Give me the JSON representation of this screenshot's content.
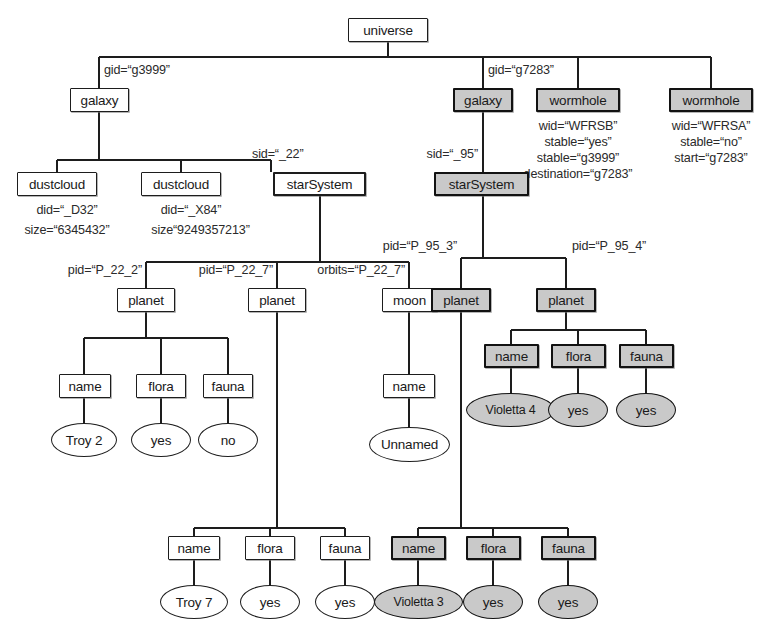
{
  "diagram": {
    "colors": {
      "line": "#1d1d1d",
      "shaded_fill": "#c9c9c9",
      "plain_fill": "#ffffff",
      "text": "#1a1a1a"
    }
  },
  "nodes": {
    "universe": {
      "label": "universe",
      "kind": "element",
      "shaded": false
    },
    "galaxy_left": {
      "label": "galaxy",
      "kind": "element",
      "shaded": false
    },
    "galaxy_right": {
      "label": "galaxy",
      "kind": "element",
      "shaded": true
    },
    "wormhole_b": {
      "label": "wormhole",
      "kind": "element",
      "shaded": true
    },
    "wormhole_a": {
      "label": "wormhole",
      "kind": "element",
      "shaded": true
    },
    "dustcloud_1": {
      "label": "dustcloud",
      "kind": "element",
      "shaded": false
    },
    "dustcloud_2": {
      "label": "dustcloud",
      "kind": "element",
      "shaded": false
    },
    "starsystem_22": {
      "label": "starSystem",
      "kind": "element",
      "shaded": false
    },
    "starsystem_95": {
      "label": "starSystem",
      "kind": "element",
      "shaded": true
    },
    "planet_22_2": {
      "label": "planet",
      "kind": "element",
      "shaded": false
    },
    "planet_22_7": {
      "label": "planet",
      "kind": "element",
      "shaded": false
    },
    "moon_22_7": {
      "label": "moon",
      "kind": "element",
      "shaded": false
    },
    "planet_95_3": {
      "label": "planet",
      "kind": "element",
      "shaded": true
    },
    "planet_95_4": {
      "label": "planet",
      "kind": "element",
      "shaded": true
    },
    "name_t2": {
      "label": "name",
      "kind": "element",
      "shaded": false
    },
    "flora_t2": {
      "label": "flora",
      "kind": "element",
      "shaded": false
    },
    "fauna_t2": {
      "label": "fauna",
      "kind": "element",
      "shaded": false
    },
    "val_troy2": {
      "label": "Troy 2",
      "kind": "text",
      "shaded": false
    },
    "val_t2_flora": {
      "label": "yes",
      "kind": "text",
      "shaded": false
    },
    "val_t2_fauna": {
      "label": "no",
      "kind": "text",
      "shaded": false
    },
    "name_moon": {
      "label": "name",
      "kind": "element",
      "shaded": false
    },
    "val_unnamed": {
      "label": "Unnamed",
      "kind": "text",
      "shaded": false
    },
    "name_v4": {
      "label": "name",
      "kind": "element",
      "shaded": true
    },
    "flora_v4": {
      "label": "flora",
      "kind": "element",
      "shaded": true
    },
    "fauna_v4": {
      "label": "fauna",
      "kind": "element",
      "shaded": true
    },
    "val_violetta4": {
      "label": "Violetta 4",
      "kind": "text",
      "shaded": true
    },
    "val_v4_flora": {
      "label": "yes",
      "kind": "text",
      "shaded": true
    },
    "val_v4_fauna": {
      "label": "yes",
      "kind": "text",
      "shaded": true
    },
    "name_t7": {
      "label": "name",
      "kind": "element",
      "shaded": false
    },
    "flora_t7": {
      "label": "flora",
      "kind": "element",
      "shaded": false
    },
    "fauna_t7": {
      "label": "fauna",
      "kind": "element",
      "shaded": false
    },
    "val_troy7": {
      "label": "Troy 7",
      "kind": "text",
      "shaded": false
    },
    "val_t7_flora": {
      "label": "yes",
      "kind": "text",
      "shaded": false
    },
    "val_t7_fauna": {
      "label": "yes",
      "kind": "text",
      "shaded": false
    },
    "name_v3": {
      "label": "name",
      "kind": "element",
      "shaded": true
    },
    "flora_v3": {
      "label": "flora",
      "kind": "element",
      "shaded": true
    },
    "fauna_v3": {
      "label": "fauna",
      "kind": "element",
      "shaded": true
    },
    "val_violetta3": {
      "label": "Violetta 3",
      "kind": "text",
      "shaded": true
    },
    "val_v3_flora": {
      "label": "yes",
      "kind": "text",
      "shaded": true
    },
    "val_v3_fauna": {
      "label": "yes",
      "kind": "text",
      "shaded": true
    }
  },
  "attributes": {
    "gid_g3999": "gid=“g3999”",
    "gid_g7283": "gid=“g7283”",
    "did_d32": "did=“_D32”",
    "size_d32": "size=“6345432”",
    "did_x84": "did=“_X84”",
    "size_x84": "size“9249357213”",
    "sid_22": "sid=“_22”",
    "sid_95": "sid=“_95”",
    "pid_22_2": "pid=“P_22_2”",
    "pid_22_7": "pid=“P_22_7”",
    "orbits_22_7": "orbits=“P_22_7”",
    "pid_95_3": "pid=“P_95_3”",
    "pid_95_4": "pid=“P_95_4”",
    "wh_b_wid": "wid=“WFRSB”",
    "wh_b_stable": "stable=“yes”",
    "wh_b_stable2": "stable=“g3999”",
    "wh_b_destination": "destination=“g7283”",
    "wh_a_wid": "wid=“WFRSA”",
    "wh_a_stable": "stable=“no”",
    "wh_a_start": "start=“g7283”"
  }
}
